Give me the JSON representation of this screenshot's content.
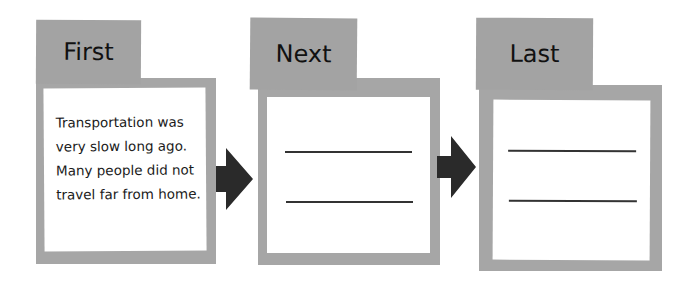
{
  "diagram": {
    "type": "sequence-organizer",
    "colors": {
      "frame": "#a6a6a6",
      "tab": "#a3a3a3",
      "arrow": "#2a2a2a",
      "card": "#ffffff"
    },
    "steps": [
      {
        "label": "First",
        "text": "Transportation was very slow long ago. Many people did not travel far from home.",
        "blank_lines": 0
      },
      {
        "label": "Next",
        "text": "",
        "blank_lines": 2
      },
      {
        "label": "Last",
        "text": "",
        "blank_lines": 2
      }
    ],
    "arrows": [
      "arrow-right-icon",
      "arrow-right-icon"
    ]
  }
}
